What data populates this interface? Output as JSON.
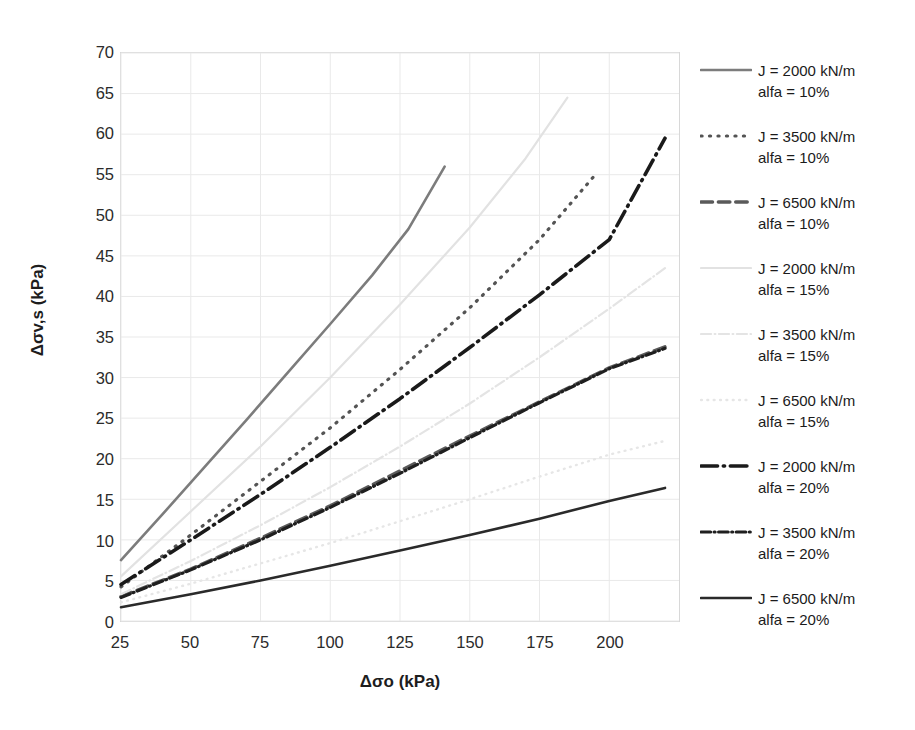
{
  "chart_data": {
    "type": "line",
    "title": "",
    "xlabel": "Δσo (kPa)",
    "ylabel": "Δσv,s (kPa)",
    "xlim": [
      25,
      225
    ],
    "ylim": [
      0,
      70
    ],
    "xticks": [
      25,
      50,
      75,
      100,
      125,
      150,
      175,
      200
    ],
    "yticks": [
      0,
      5,
      10,
      15,
      20,
      25,
      30,
      35,
      40,
      45,
      50,
      55,
      60,
      65,
      70
    ],
    "grid": true,
    "legend_position": "right",
    "series": [
      {
        "name": "J = 2000 kN/m\nalfa = 10%",
        "J": 2000,
        "alfa": "10%",
        "style": "solid",
        "color": "#7c7c7c",
        "width": 2.6,
        "x": [
          25,
          40,
          55,
          70,
          85,
          100,
          115,
          128,
          141
        ],
        "y": [
          7.5,
          13.2,
          19.0,
          24.8,
          30.7,
          36.6,
          42.6,
          48.3,
          56.0
        ]
      },
      {
        "name": "J = 3500 kN/m\nalfa = 10%",
        "J": 3500,
        "alfa": "10%",
        "style": "dotted",
        "color": "#545454",
        "width": 3.2,
        "x": [
          25,
          50,
          75,
          100,
          125,
          150,
          175,
          195
        ],
        "y": [
          4.2,
          10.6,
          17.2,
          23.8,
          31.0,
          38.6,
          47.0,
          55.0
        ]
      },
      {
        "name": "J = 6500 kN/m\nalfa = 10%",
        "J": 6500,
        "alfa": "10%",
        "style": "dashed",
        "color": "#5a5a5a",
        "width": 3.4,
        "x": [
          25,
          50,
          75,
          100,
          125,
          150,
          175,
          200,
          220
        ],
        "y": [
          3.0,
          6.4,
          10.2,
          14.2,
          18.5,
          22.8,
          27.0,
          31.2,
          33.8
        ]
      },
      {
        "name": "J = 2000 kN/m\nalfa = 15%",
        "J": 2000,
        "alfa": "15%",
        "style": "solid",
        "color": "#e2e2e2",
        "width": 2.2,
        "x": [
          25,
          50,
          75,
          100,
          125,
          150,
          170,
          185
        ],
        "y": [
          5.5,
          13.5,
          21.5,
          30.0,
          39.0,
          48.5,
          57.0,
          64.5
        ]
      },
      {
        "name": "J = 3500 kN/m\nalfa = 15%",
        "J": 3500,
        "alfa": "15%",
        "style": "dashdot",
        "color": "#e4e4e4",
        "width": 2.2,
        "x": [
          25,
          50,
          75,
          100,
          125,
          150,
          175,
          200,
          220
        ],
        "y": [
          3.3,
          7.4,
          11.8,
          16.5,
          21.5,
          26.8,
          32.5,
          38.5,
          43.5
        ]
      },
      {
        "name": "J = 6500 kN/m\nalfa = 15%",
        "J": 6500,
        "alfa": "15%",
        "style": "dotted",
        "color": "#e6e6e6",
        "width": 2.4,
        "x": [
          25,
          50,
          75,
          100,
          125,
          150,
          175,
          200,
          220
        ],
        "y": [
          2.3,
          4.6,
          7.1,
          9.6,
          12.3,
          15.0,
          17.8,
          20.5,
          22.2
        ]
      },
      {
        "name": "J = 2000 kN/m\nalfa = 20%",
        "J": 2000,
        "alfa": "20%",
        "style": "dashdot",
        "color": "#1a1a1a",
        "width": 3.6,
        "x": [
          25,
          50,
          75,
          100,
          125,
          150,
          175,
          200,
          220
        ],
        "y": [
          4.5,
          10.0,
          15.6,
          21.4,
          27.4,
          33.7,
          40.2,
          47.0,
          59.5
        ]
      },
      {
        "name": "J = 3500 kN/m\nalfa = 20%",
        "J": 3500,
        "alfa": "20%",
        "style": "dashdot-dense",
        "color": "#1f1f1f",
        "width": 3.2,
        "x": [
          25,
          50,
          75,
          100,
          125,
          150,
          175,
          200,
          220
        ],
        "y": [
          2.9,
          6.3,
          10.0,
          14.0,
          18.2,
          22.6,
          26.9,
          31.1,
          33.6
        ]
      },
      {
        "name": "J = 6500 kN/m\nalfa = 20%",
        "J": 6500,
        "alfa": "20%",
        "style": "solid",
        "color": "#2a2a2a",
        "width": 2.6,
        "x": [
          25,
          50,
          75,
          100,
          125,
          150,
          175,
          200,
          220
        ],
        "y": [
          1.7,
          3.3,
          5.0,
          6.8,
          8.7,
          10.6,
          12.6,
          14.8,
          16.4
        ]
      }
    ]
  },
  "axis": {
    "xlabel": "Δσo (kPa)",
    "ylabel": "Δσv,s (kPa)"
  },
  "legend": {
    "entries": [
      {
        "label": "J = 2000 kN/m\nalfa = 10%"
      },
      {
        "label": "J = 3500 kN/m\nalfa = 10%"
      },
      {
        "label": "J = 6500 kN/m\nalfa = 10%"
      },
      {
        "label": "J = 2000 kN/m\nalfa = 15%"
      },
      {
        "label": "J = 3500 kN/m\nalfa = 15%"
      },
      {
        "label": "J = 6500 kN/m\nalfa = 15%"
      },
      {
        "label": "J = 2000 kN/m\nalfa = 20%"
      },
      {
        "label": "J = 3500 kN/m\nalfa = 20%"
      },
      {
        "label": "J = 6500 kN/m\nalfa = 20%"
      }
    ]
  },
  "colors": {
    "grid": "#e9e9e9",
    "frame": "#d8d8d8",
    "text": "#1d1d1d",
    "background": "#ffffff"
  }
}
